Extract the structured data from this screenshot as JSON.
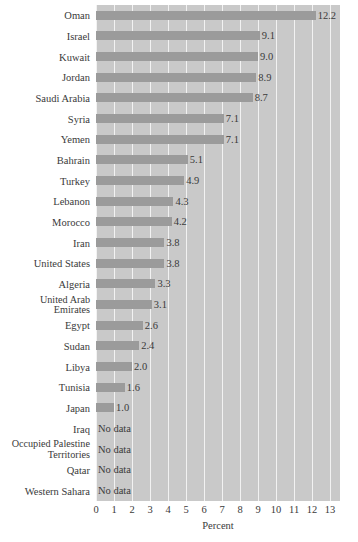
{
  "chart_data": {
    "type": "bar",
    "orientation": "horizontal",
    "title": "",
    "xlabel": "Percent",
    "ylabel": "",
    "xlim": [
      0,
      13.55
    ],
    "xticks": [
      0,
      1,
      2,
      3,
      4,
      5,
      6,
      7,
      8,
      9,
      10,
      11,
      12,
      13
    ],
    "grid": "vertical",
    "legend": "none",
    "bar_color": "#9b9b9b",
    "plot_background": "#c9c9c9",
    "gridline_color": "#f2f2f2",
    "no_data_text": "No data",
    "categories": [
      "Oman",
      "Israel",
      "Kuwait",
      "Jordan",
      "Saudi Arabia",
      "Syria",
      "Yemen",
      "Bahrain",
      "Turkey",
      "Lebanon",
      "Morocco",
      "Iran",
      "United States",
      "Algeria",
      "United Arab Emirates",
      "Egypt",
      "Sudan",
      "Libya",
      "Tunisia",
      "Japan",
      "Iraq",
      "Occupied Palestine Territories",
      "Qatar",
      "Western Sahara"
    ],
    "values": [
      12.2,
      9.1,
      9.0,
      8.9,
      8.7,
      7.1,
      7.1,
      5.1,
      4.9,
      4.3,
      4.2,
      3.8,
      3.8,
      3.3,
      3.1,
      2.6,
      2.4,
      2.0,
      1.6,
      1.0,
      null,
      null,
      null,
      null
    ],
    "value_labels": [
      "12.2",
      "9.1",
      "9.0",
      "8.9",
      "8.7",
      "7.1",
      "7.1",
      "5.1",
      "4.9",
      "4.3",
      "4.2",
      "3.8",
      "3.8",
      "3.3",
      "3.1",
      "2.6",
      "2.4",
      "2.0",
      "1.6",
      "1.0",
      "No data",
      "No data",
      "No data",
      "No data"
    ],
    "category_label_lines": [
      [
        "Oman"
      ],
      [
        "Israel"
      ],
      [
        "Kuwait"
      ],
      [
        "Jordan"
      ],
      [
        "Saudi Arabia"
      ],
      [
        "Syria"
      ],
      [
        "Yemen"
      ],
      [
        "Bahrain"
      ],
      [
        "Turkey"
      ],
      [
        "Lebanon"
      ],
      [
        "Morocco"
      ],
      [
        "Iran"
      ],
      [
        "United States"
      ],
      [
        "Algeria"
      ],
      [
        "United Arab",
        "Emirates"
      ],
      [
        "Egypt"
      ],
      [
        "Sudan"
      ],
      [
        "Libya"
      ],
      [
        "Tunisia"
      ],
      [
        "Japan"
      ],
      [
        "Iraq"
      ],
      [
        "Occupied Palestine",
        "Territories"
      ],
      [
        "Qatar"
      ],
      [
        "Western Sahara"
      ]
    ]
  }
}
